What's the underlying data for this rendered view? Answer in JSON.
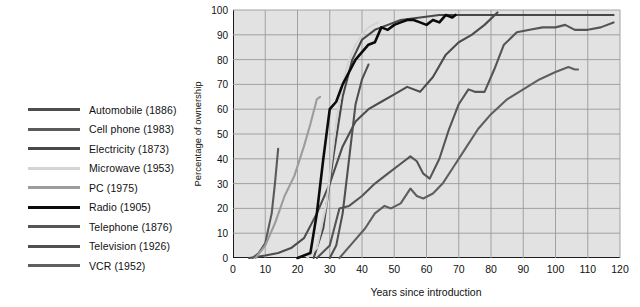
{
  "chart_data": {
    "type": "line",
    "title": "",
    "xlabel": "Years since introduction",
    "ylabel": "Percentage of ownership",
    "xlim": [
      0,
      120
    ],
    "ylim": [
      0,
      100
    ],
    "xticks": [
      0,
      10,
      20,
      30,
      40,
      50,
      60,
      70,
      80,
      90,
      100,
      110,
      120
    ],
    "yticks": [
      0,
      10,
      20,
      30,
      40,
      50,
      60,
      70,
      80,
      90,
      100
    ],
    "grid": true,
    "legend_position": "left-outside",
    "plot_background": "#e2e2e2",
    "series": [
      {
        "name": "Automobile (1886)",
        "label": "Automobile (1886)",
        "year": 1886,
        "color": "#4d4d4d",
        "points": [
          [
            5,
            0
          ],
          [
            10,
            1
          ],
          [
            14,
            2
          ],
          [
            18,
            4
          ],
          [
            22,
            8
          ],
          [
            26,
            18
          ],
          [
            30,
            30
          ],
          [
            34,
            45
          ],
          [
            38,
            55
          ],
          [
            42,
            60
          ],
          [
            46,
            63
          ],
          [
            50,
            66
          ],
          [
            54,
            69
          ],
          [
            58,
            67
          ],
          [
            62,
            73
          ],
          [
            66,
            82
          ],
          [
            70,
            87
          ],
          [
            74,
            90
          ],
          [
            78,
            94
          ],
          [
            82,
            99
          ]
        ]
      },
      {
        "name": "Cell phone (1983)",
        "label": "Cell phone (1983)",
        "year": 1983,
        "color": "#5a5a5a",
        "points": [
          [
            6,
            0
          ],
          [
            8,
            2
          ],
          [
            10,
            6
          ],
          [
            12,
            18
          ],
          [
            13,
            30
          ],
          [
            14,
            44
          ]
        ]
      },
      {
        "name": "Electricity (1873)",
        "label": "Electricity (1873)",
        "year": 1873,
        "color": "#484848",
        "points": [
          [
            25,
            0
          ],
          [
            28,
            12
          ],
          [
            31,
            40
          ],
          [
            34,
            65
          ],
          [
            37,
            80
          ],
          [
            40,
            88
          ],
          [
            44,
            92
          ],
          [
            48,
            94
          ],
          [
            52,
            96
          ],
          [
            58,
            97
          ],
          [
            64,
            98
          ],
          [
            70,
            98
          ],
          [
            76,
            98
          ],
          [
            82,
            98
          ],
          [
            90,
            98
          ],
          [
            100,
            98
          ],
          [
            110,
            98
          ],
          [
            118,
            98
          ]
        ]
      },
      {
        "name": "Microwave (1953)",
        "label": "Microwave (1953)",
        "year": 1953,
        "color": "#d4d4d4",
        "points": [
          [
            23,
            0
          ],
          [
            26,
            4
          ],
          [
            29,
            22
          ],
          [
            32,
            55
          ],
          [
            34,
            70
          ],
          [
            36,
            80
          ],
          [
            38,
            86
          ],
          [
            40,
            90
          ],
          [
            42,
            93
          ],
          [
            45,
            95
          ]
        ]
      },
      {
        "name": "PC (1975)",
        "label": "PC (1975)",
        "year": 1975,
        "color": "#9c9c9c",
        "points": [
          [
            7,
            0
          ],
          [
            10,
            5
          ],
          [
            13,
            14
          ],
          [
            16,
            25
          ],
          [
            19,
            33
          ],
          [
            22,
            45
          ],
          [
            24,
            54
          ],
          [
            26,
            64
          ],
          [
            27,
            65
          ]
        ]
      },
      {
        "name": "Radio (1905)",
        "label": "Radio (1905)",
        "year": 1905,
        "color": "#0b0b0b",
        "points": [
          [
            20,
            0
          ],
          [
            24,
            2
          ],
          [
            26,
            18
          ],
          [
            28,
            40
          ],
          [
            30,
            60
          ],
          [
            32,
            63
          ],
          [
            34,
            70
          ],
          [
            36,
            75
          ],
          [
            38,
            80
          ],
          [
            40,
            83
          ],
          [
            42,
            86
          ],
          [
            44,
            87
          ],
          [
            46,
            93
          ],
          [
            48,
            92
          ],
          [
            50,
            94
          ],
          [
            52,
            95
          ],
          [
            54,
            96
          ],
          [
            56,
            96
          ],
          [
            58,
            95
          ],
          [
            60,
            94
          ],
          [
            62,
            96
          ],
          [
            64,
            95
          ],
          [
            66,
            98
          ],
          [
            68,
            97
          ],
          [
            69,
            98
          ]
        ]
      },
      {
        "name": "Telephone (1876)",
        "label": "Telephone (1876)",
        "year": 1876,
        "color": "#555555",
        "points": [
          [
            26,
            0
          ],
          [
            30,
            5
          ],
          [
            33,
            20
          ],
          [
            36,
            21
          ],
          [
            40,
            25
          ],
          [
            44,
            30
          ],
          [
            48,
            34
          ],
          [
            52,
            38
          ],
          [
            55,
            41
          ],
          [
            57,
            39
          ],
          [
            59,
            34
          ],
          [
            61,
            32
          ],
          [
            64,
            40
          ],
          [
            67,
            52
          ],
          [
            70,
            62
          ],
          [
            73,
            68
          ],
          [
            75,
            67
          ],
          [
            78,
            67
          ],
          [
            81,
            76
          ],
          [
            84,
            86
          ],
          [
            88,
            91
          ],
          [
            92,
            92
          ],
          [
            96,
            93
          ],
          [
            100,
            93
          ],
          [
            103,
            94
          ],
          [
            106,
            92
          ],
          [
            110,
            92
          ],
          [
            114,
            93
          ],
          [
            118,
            95
          ]
        ]
      },
      {
        "name": "Television (1926)",
        "label": "Television (1926)",
        "year": 1926,
        "color": "#505050",
        "points": [
          [
            30,
            0
          ],
          [
            32,
            5
          ],
          [
            34,
            18
          ],
          [
            36,
            40
          ],
          [
            38,
            62
          ],
          [
            40,
            72
          ],
          [
            42,
            78
          ]
        ]
      },
      {
        "name": "VCR (1952)",
        "label": "VCR (1952)",
        "year": 1952,
        "color": "#5f5f5f",
        "points": [
          [
            33,
            0
          ],
          [
            37,
            6
          ],
          [
            41,
            12
          ],
          [
            44,
            18
          ],
          [
            47,
            21
          ],
          [
            49,
            20
          ],
          [
            52,
            22
          ],
          [
            55,
            28
          ],
          [
            57,
            25
          ],
          [
            59,
            24
          ],
          [
            62,
            26
          ],
          [
            65,
            30
          ],
          [
            68,
            36
          ],
          [
            72,
            44
          ],
          [
            76,
            52
          ],
          [
            80,
            58
          ],
          [
            85,
            64
          ],
          [
            90,
            68
          ],
          [
            95,
            72
          ],
          [
            100,
            75
          ],
          [
            104,
            77
          ],
          [
            106,
            76
          ],
          [
            107,
            76
          ]
        ]
      }
    ]
  }
}
